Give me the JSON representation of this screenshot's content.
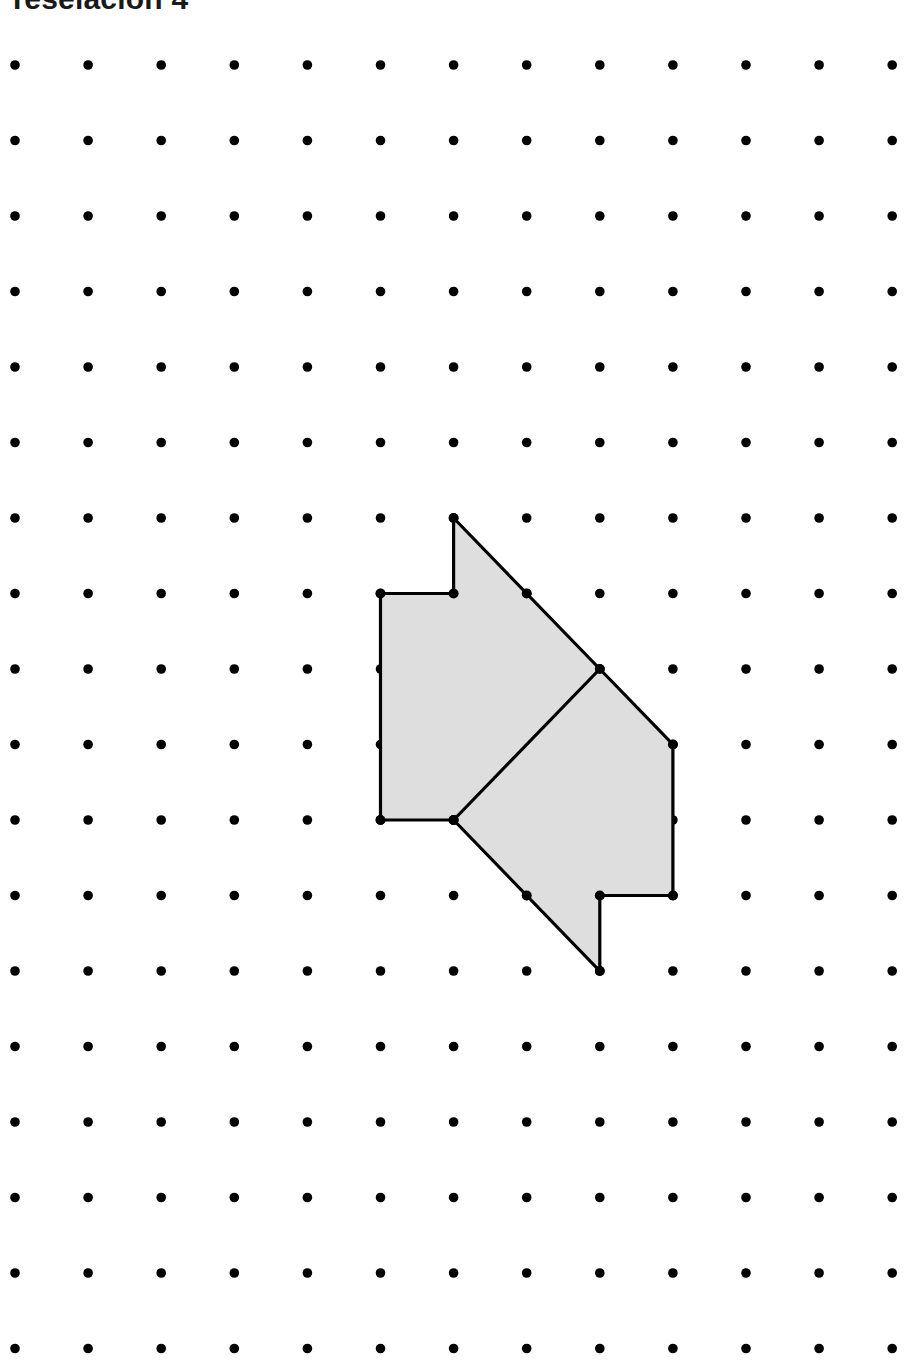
{
  "page": {
    "title_text": "Teselación 4",
    "background_color": "#ffffff",
    "width": 914,
    "height": 1364
  },
  "grid": {
    "name": "dot-lattice",
    "columns": 13,
    "rows": 18,
    "origin_x": 15,
    "origin_y": 65,
    "spacing_x": 73.1,
    "spacing_y": 75.5,
    "dot_radius": 4.8,
    "dot_color": "#000000"
  },
  "figure": {
    "name": "shaded-tessellation-tile",
    "fill_color": "#dedede",
    "stroke_color": "#000000",
    "stroke_width": 3.2,
    "vertex_marker_radius": 5.0,
    "vertex_marker_color": "#000000",
    "outline_grid_points": [
      [
        6,
        6
      ],
      [
        8,
        8
      ],
      [
        9,
        9
      ],
      [
        9,
        11
      ],
      [
        8,
        11
      ],
      [
        8,
        12
      ],
      [
        6,
        10
      ],
      [
        5,
        10
      ],
      [
        5,
        7
      ],
      [
        6,
        7
      ]
    ],
    "interior_segments": [
      {
        "name": "interior-diagonal",
        "from": [
          8,
          8
        ],
        "to": [
          6,
          10
        ]
      }
    ],
    "marked_vertices": [
      [
        6,
        6
      ],
      [
        7,
        7
      ],
      [
        8,
        8
      ],
      [
        9,
        9
      ],
      [
        9,
        11
      ],
      [
        8,
        11
      ],
      [
        8,
        12
      ],
      [
        7,
        11
      ],
      [
        6,
        10
      ],
      [
        5,
        10
      ],
      [
        6,
        10
      ],
      [
        5,
        7
      ],
      [
        6,
        7
      ]
    ]
  }
}
